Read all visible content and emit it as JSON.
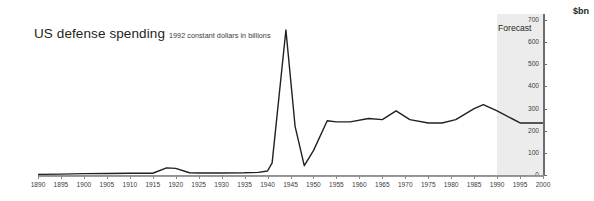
{
  "header": {
    "title": "US defense spending",
    "subtitle": "1992 constant dollars in billions",
    "unit_label": "$bn"
  },
  "annotations": {
    "forecast_label": "Forecast",
    "forecast_start_year": 1990,
    "forecast_end_year": 2000
  },
  "colors": {
    "line": "#231f20",
    "axis": "#6d6d6d",
    "forecast_band": "#ececec",
    "background": "#ffffff",
    "text": "#231f20"
  },
  "chart_data": {
    "type": "line",
    "title": "US defense spending",
    "subtitle": "1992 constant dollars in billions",
    "xlabel": "",
    "ylabel": "$bn",
    "xlim": [
      1890,
      2000
    ],
    "ylim": [
      0,
      700
    ],
    "grid": false,
    "legend": "none",
    "y_axis_position": "right",
    "y_ticks": [
      0,
      100,
      200,
      300,
      400,
      500,
      600,
      700
    ],
    "x_ticks": [
      1890,
      1895,
      1900,
      1905,
      1910,
      1915,
      1920,
      1925,
      1930,
      1935,
      1940,
      1945,
      1950,
      1955,
      1960,
      1965,
      1970,
      1975,
      1980,
      1985,
      1990,
      1995,
      2000
    ],
    "series": [
      {
        "name": "US defense spending",
        "x": [
          1890,
          1895,
          1900,
          1905,
          1910,
          1915,
          1918,
          1920,
          1923,
          1925,
          1930,
          1935,
          1938,
          1940,
          1941,
          1944,
          1946,
          1948,
          1950,
          1953,
          1955,
          1958,
          1962,
          1965,
          1968,
          1971,
          1975,
          1978,
          1981,
          1985,
          1987,
          1990,
          1995,
          2000
        ],
        "values": [
          3,
          4,
          6,
          7,
          8,
          8,
          32,
          30,
          10,
          9,
          9,
          10,
          12,
          18,
          55,
          655,
          220,
          42,
          110,
          245,
          240,
          240,
          255,
          250,
          290,
          250,
          235,
          235,
          250,
          300,
          318,
          290,
          235,
          235
        ]
      }
    ],
    "annotations": [
      {
        "text": "Forecast",
        "x_start": 1990,
        "x_end": 2000,
        "type": "shaded-band"
      }
    ]
  },
  "x_axis_labels": [
    "1890",
    "1895",
    "1900",
    "1905",
    "1910",
    "1915",
    "1920",
    "1925",
    "1930",
    "1935",
    "1940",
    "1945",
    "1950",
    "1955",
    "1960",
    "1965",
    "1970",
    "1975",
    "1980",
    "1985",
    "1990",
    "1995",
    "2000"
  ],
  "y_axis_labels": [
    "700",
    "600",
    "500",
    "400",
    "300",
    "200",
    "100",
    "0"
  ]
}
